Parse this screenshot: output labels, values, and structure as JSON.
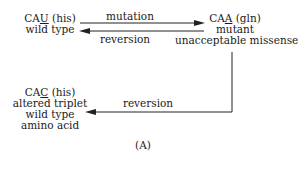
{
  "nodes": {
    "wild": {
      "codon_pre": "CA",
      "codon_ul": "U",
      "codon_post": "",
      "aa": " (his)",
      "lines": [
        "wild type"
      ]
    },
    "mutant": {
      "codon_pre": "CA",
      "codon_ul": "A",
      "codon_post": "",
      "aa": " (gln)",
      "lines": [
        "mutant",
        "unacceptable missense"
      ]
    },
    "altered": {
      "codon_pre": "CA",
      "codon_ul": "C",
      "codon_post": "",
      "aa": " (his)",
      "lines": [
        "altered triplet",
        "wild type",
        "amino acid"
      ]
    }
  },
  "edges": {
    "forward": "mutation",
    "back": "reversion",
    "second": "reversion"
  },
  "caption": "(A)"
}
